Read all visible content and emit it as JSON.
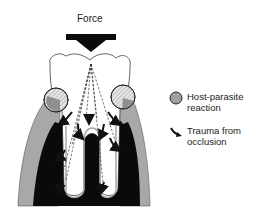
{
  "diagram": {
    "title": "",
    "force_label": "Force",
    "colors": {
      "bone_gray": "#a8a8a8",
      "bone_black": "#0a0a0a",
      "tooth_fill": "#ffffff",
      "outline": "#222222",
      "inflammation": "#9a9a9a",
      "hatch": "#cfcfcf"
    },
    "elements": [
      {
        "id": "force-arrow",
        "type": "arrow",
        "direction": "down",
        "label": "Force"
      },
      {
        "id": "tooth-crown",
        "type": "outline"
      },
      {
        "id": "left-lesion",
        "type": "circle",
        "meaning": "Host-parasite reaction"
      },
      {
        "id": "right-lesion",
        "type": "circle",
        "meaning": "Host-parasite reaction"
      },
      {
        "id": "force-lines",
        "type": "dashed-lines"
      },
      {
        "id": "trauma-arrows",
        "type": "arrows",
        "meaning": "Trauma from occlusion"
      }
    ]
  },
  "legend": {
    "items": [
      {
        "icon": "gray-circle-icon",
        "lines": [
          "Host-parasite",
          "reaction"
        ]
      },
      {
        "icon": "curved-arrow-icon",
        "lines": [
          "Trauma from",
          "occlusion"
        ]
      }
    ]
  }
}
